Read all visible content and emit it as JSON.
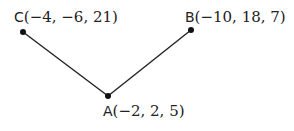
{
  "diagram": {
    "points": [
      {
        "id": "C",
        "name": "C",
        "coords": "(−4,  −6,  21)",
        "x": 23,
        "y": 32
      },
      {
        "id": "B",
        "name": "B",
        "coords": "(−10, 18,  7)",
        "x": 191,
        "y": 30
      },
      {
        "id": "A",
        "name": "A",
        "coords": "(−2,  2,  5)",
        "x": 108,
        "y": 96
      }
    ],
    "edges": [
      [
        "C",
        "A"
      ],
      [
        "A",
        "B"
      ]
    ],
    "line_color": "#222222"
  }
}
